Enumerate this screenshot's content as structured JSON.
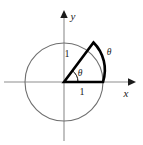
{
  "figure": {
    "name": "unit-circle-sector-diagram",
    "background_color": "#ffffff",
    "axes": {
      "x_label": "x",
      "y_label": "y",
      "axis_color": "#8e8e8e",
      "arrow_color": "#1b1b1b",
      "origin": {
        "x": 64,
        "y": 82
      },
      "x_axis": {
        "start_x": 4,
        "end_x": 136,
        "y": 82
      },
      "y_axis": {
        "x": 64,
        "start_y": 140,
        "end_y": 10
      }
    },
    "circle": {
      "center_x": 64,
      "center_y": 82,
      "radius": 39,
      "stroke_color": "#6f6f6f"
    },
    "sector": {
      "angle_degrees": 53,
      "radius": 39,
      "stroke_color": "#000000",
      "stroke_width": 2.6,
      "radius_endpoint": {
        "x": 93,
        "y": 43
      },
      "arc_endpoint": {
        "x": 103,
        "y": 82
      }
    },
    "angle_arc": {
      "radius": 14,
      "stroke_color": "#000000"
    },
    "labels": {
      "theta_inner": "θ",
      "theta_outer": "θ",
      "radius_label": "1",
      "base_label": "1",
      "x_axis_label": "x",
      "y_axis_label": "y"
    }
  }
}
